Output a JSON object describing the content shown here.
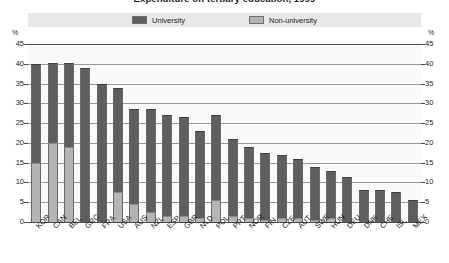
{
  "chart_data": {
    "type": "bar",
    "stacked": true,
    "title": "Expenditure on tertiary education, 1999",
    "xlabel": "",
    "ylabel": "%",
    "ylim": [
      0,
      45
    ],
    "yticks": [
      0,
      5,
      10,
      15,
      20,
      25,
      30,
      35,
      40,
      45
    ],
    "unit_label": "%",
    "grid": true,
    "legend_position": "top-center",
    "legend": [
      "University",
      "Non-university"
    ],
    "categories": [
      "KOR",
      "CAN",
      "BEL",
      "GRC",
      "FRA",
      "USA",
      "AUS",
      "NZL",
      "ESP",
      "GBR",
      "NLD",
      "POL",
      "PRT",
      "NOR",
      "FIN",
      "CZE",
      "AUT",
      "SWE",
      "HUN",
      "DEU",
      "DNK",
      "CHE",
      "ISL",
      "MEX"
    ],
    "series": [
      {
        "name": "University",
        "color": "#5e5e5e",
        "values": [
          25.0,
          20.2,
          21.3,
          39.0,
          35.0,
          26.3,
          24.0,
          26.0,
          25.5,
          25.0,
          22.0,
          21.5,
          19.5,
          18.0,
          17.0,
          16.0,
          15.0,
          13.5,
          12.0,
          11.5,
          8.0,
          8.0,
          7.5,
          5.5
        ]
      },
      {
        "name": "Non-university",
        "color": "#b4b4b4",
        "values": [
          15.0,
          20.0,
          19.0,
          0.0,
          0.0,
          7.7,
          4.5,
          2.5,
          1.5,
          1.5,
          1.0,
          5.5,
          1.5,
          1.0,
          0.5,
          1.0,
          1.0,
          0.5,
          1.0,
          0.0,
          0.0,
          0.0,
          0.0,
          0.0
        ]
      }
    ],
    "totals": [
      40.0,
      40.2,
      40.3,
      39.0,
      35.0,
      34.0,
      28.5,
      28.5,
      27.0,
      26.5,
      23.0,
      27.0,
      21.0,
      19.0,
      17.5,
      17.0,
      16.0,
      14.0,
      13.0,
      11.5,
      8.0,
      8.0,
      7.5,
      5.5
    ]
  },
  "legend": {
    "university": "University",
    "non_university": "Non-university"
  },
  "axis": {
    "unit_left": "%",
    "unit_right": "%"
  }
}
